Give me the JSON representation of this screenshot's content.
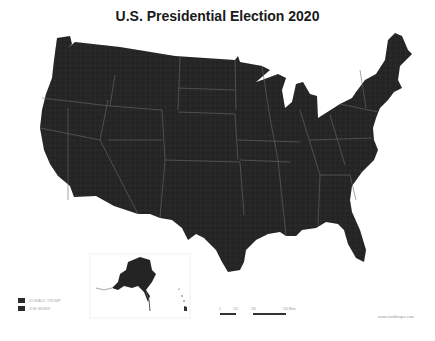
{
  "title": "U.S. Presidential Election 2020",
  "colors": {
    "map_fill": "#242424",
    "borders": "#555555",
    "background": "#ffffff"
  },
  "legend": {
    "items": [
      {
        "label": "DONALD TRUMP",
        "color": "#2a2a2a"
      },
      {
        "label": "JOE BIDEN",
        "color": "#2a2a2a"
      }
    ]
  },
  "scale_bar": {
    "ticks": [
      "0",
      "125",
      "250",
      "500 Miles"
    ]
  },
  "credit": "www.vividmaps.com",
  "insets": [
    "Alaska",
    "Hawaii"
  ]
}
